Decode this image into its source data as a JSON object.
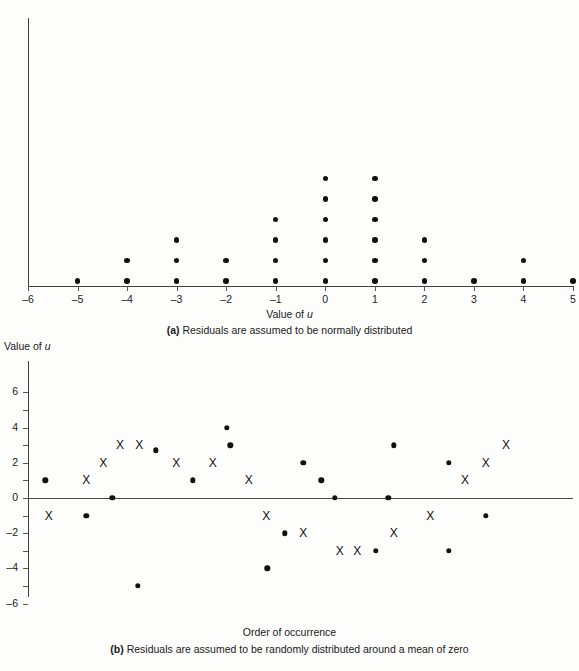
{
  "panel_a": {
    "xaxis_label_prefix": "Value of ",
    "xaxis_label_italic": "u",
    "caption_tag": "(a)",
    "caption_text": "Residuals are assumed to be normally distributed",
    "tick_labels": [
      "–6",
      "–5",
      "–4",
      "–3",
      "–2",
      "–1",
      "0",
      "1",
      "2",
      "3",
      "4",
      "5"
    ]
  },
  "panel_b": {
    "yaxis_label_prefix": "Value of ",
    "yaxis_label_italic": "u",
    "xaxis_label": "Order of occurrence",
    "caption_tag": "(b)",
    "caption_text": "Residuals are assumed to be randomly distributed around a mean of zero",
    "tick_labels": [
      "6",
      "4",
      "2",
      "0",
      "–2",
      "–4",
      "–6"
    ]
  },
  "chart_data": [
    {
      "type": "scatter",
      "panel": "a",
      "title": "(a) Residuals are assumed to be normally distributed",
      "xlabel": "Value of u",
      "ylabel": "",
      "xlim": [
        -6,
        5
      ],
      "ylim": [
        0,
        7
      ],
      "grid": false,
      "legend": "none",
      "description": "Dot plot / stacked frequency histogram of residual values",
      "categories": [
        -6,
        -5,
        -4,
        -3,
        -2,
        -1,
        0,
        1,
        2,
        3,
        4,
        5
      ],
      "values": [
        0,
        1,
        2,
        3,
        2,
        4,
        6,
        6,
        3,
        1,
        2,
        1
      ],
      "points": [
        {
          "x": -5,
          "y": 1
        },
        {
          "x": -4,
          "y": 1
        },
        {
          "x": -4,
          "y": 2
        },
        {
          "x": -3,
          "y": 1
        },
        {
          "x": -3,
          "y": 2
        },
        {
          "x": -3,
          "y": 3
        },
        {
          "x": -2,
          "y": 1
        },
        {
          "x": -2,
          "y": 2
        },
        {
          "x": -1,
          "y": 1
        },
        {
          "x": -1,
          "y": 2
        },
        {
          "x": -1,
          "y": 3
        },
        {
          "x": -1,
          "y": 4
        },
        {
          "x": 0,
          "y": 1
        },
        {
          "x": 0,
          "y": 2
        },
        {
          "x": 0,
          "y": 3
        },
        {
          "x": 0,
          "y": 4
        },
        {
          "x": 0,
          "y": 5
        },
        {
          "x": 0,
          "y": 6
        },
        {
          "x": 1,
          "y": 1
        },
        {
          "x": 1,
          "y": 2
        },
        {
          "x": 1,
          "y": 3
        },
        {
          "x": 1,
          "y": 4
        },
        {
          "x": 1,
          "y": 5
        },
        {
          "x": 1,
          "y": 6
        },
        {
          "x": 2,
          "y": 1
        },
        {
          "x": 2,
          "y": 2
        },
        {
          "x": 2,
          "y": 3
        },
        {
          "x": 3,
          "y": 1
        },
        {
          "x": 4,
          "y": 1
        },
        {
          "x": 4,
          "y": 2
        },
        {
          "x": 5,
          "y": 1
        }
      ]
    },
    {
      "type": "scatter",
      "panel": "b",
      "title": "(b) Residuals are assumed to be randomly distributed around a mean of zero",
      "xlabel": "Order of occurrence",
      "ylabel": "Value of u",
      "xlim": [
        0,
        100
      ],
      "ylim": [
        -6.5,
        6.5
      ],
      "yticks": [
        -6,
        -5,
        -4,
        -3,
        -2,
        -1,
        0,
        1,
        2,
        3,
        4,
        5,
        6
      ],
      "ytick_labels_shown": [
        6,
        4,
        2,
        0,
        -2,
        -4,
        -6
      ],
      "grid": false,
      "legend": "none",
      "zero_reference_line": 0,
      "series": [
        {
          "name": "round-dot",
          "marker": "filled-circle",
          "points": [
            {
              "x": 3.2,
              "y": 1
            },
            {
              "x": 10.7,
              "y": -1
            },
            {
              "x": 15.5,
              "y": 0
            },
            {
              "x": 20.2,
              "y": -5
            },
            {
              "x": 23.5,
              "y": 2.7
            },
            {
              "x": 30.2,
              "y": 1
            },
            {
              "x": 36.5,
              "y": 4
            },
            {
              "x": 37.1,
              "y": 3
            },
            {
              "x": 43.9,
              "y": -4
            },
            {
              "x": 47.1,
              "y": -2
            },
            {
              "x": 50.5,
              "y": 2
            },
            {
              "x": 53.8,
              "y": 1
            },
            {
              "x": 56.3,
              "y": 0
            },
            {
              "x": 63.8,
              "y": -3
            },
            {
              "x": 66.1,
              "y": 0
            },
            {
              "x": 67.1,
              "y": 3
            },
            {
              "x": 77.2,
              "y": 2
            },
            {
              "x": 77.2,
              "y": -3
            },
            {
              "x": 84.0,
              "y": -1
            }
          ]
        },
        {
          "name": "x-mark",
          "marker": "x",
          "points": [
            {
              "x": 3.8,
              "y": -1
            },
            {
              "x": 10.7,
              "y": 1
            },
            {
              "x": 13.8,
              "y": 2
            },
            {
              "x": 16.9,
              "y": 3
            },
            {
              "x": 20.4,
              "y": 3
            },
            {
              "x": 27.2,
              "y": 2
            },
            {
              "x": 33.9,
              "y": 2
            },
            {
              "x": 40.5,
              "y": 1
            },
            {
              "x": 43.7,
              "y": -1
            },
            {
              "x": 50.5,
              "y": -2
            },
            {
              "x": 57.2,
              "y": -3
            },
            {
              "x": 60.4,
              "y": -3
            },
            {
              "x": 67.1,
              "y": -2
            },
            {
              "x": 73.8,
              "y": -1
            },
            {
              "x": 80.2,
              "y": 1
            },
            {
              "x": 84.0,
              "y": 2
            },
            {
              "x": 87.7,
              "y": 3
            }
          ]
        }
      ]
    }
  ]
}
